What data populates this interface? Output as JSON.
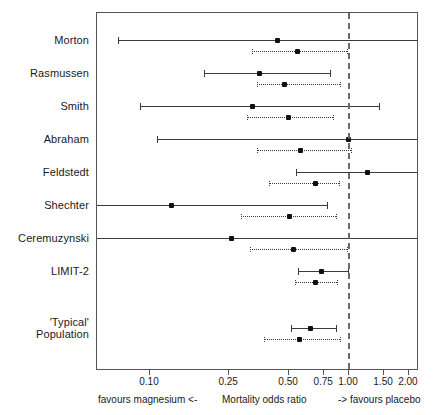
{
  "chart_data": {
    "type": "scatter",
    "subtype": "forest-plot",
    "title": "",
    "xlabel": "Mortality odds ratio",
    "ylabel": "",
    "xscale": "log",
    "xlim": [
      0.065,
      2.35
    ],
    "grid": false,
    "legend": "none",
    "reference_line": 1.0,
    "xticks": [
      0.1,
      0.25,
      0.5,
      0.75,
      1.0,
      1.5,
      2.0
    ],
    "xticklabels": [
      "0.10",
      "0.25",
      "0.50",
      "0.75",
      "1.00",
      "1.50",
      "2.00"
    ],
    "categories": [
      "Morton",
      "Rasmussen",
      "Smith",
      "Abraham",
      "Feldstedt",
      "Shechter",
      "Ceremuzynski",
      "LIMIT-2",
      "'Typical'\nPopulation"
    ],
    "series": [
      {
        "name": "Classical (solid)",
        "style": "solid",
        "estimates": [
          0.44,
          0.36,
          0.33,
          1.0,
          1.25,
          0.13,
          0.26,
          0.74,
          0.65
        ],
        "ci_low": [
          0.07,
          0.19,
          0.09,
          0.11,
          0.55,
          0.03,
          0.04,
          0.56,
          0.52
        ],
        "ci_high": [
          2.35,
          0.81,
          1.43,
          2.35,
          2.35,
          0.78,
          2.35,
          1.0,
          0.87
        ]
      },
      {
        "name": "Bayesian (dotted)",
        "style": "dotted",
        "estimates": [
          0.56,
          0.48,
          0.5,
          0.58,
          0.69,
          0.51,
          0.53,
          0.69,
          0.57
        ],
        "ci_low": [
          0.33,
          0.35,
          0.31,
          0.35,
          0.4,
          0.29,
          0.32,
          0.54,
          0.38
        ],
        "ci_high": [
          0.99,
          0.91,
          0.84,
          1.03,
          0.9,
          0.87,
          0.99,
          0.88,
          0.91
        ]
      }
    ],
    "annotations": {
      "left_caption": "favours magnesium  <-",
      "center_caption": "Mortality odds ratio",
      "right_caption": "->  favours placebo"
    }
  },
  "axis": {
    "ticks": [
      {
        "label": "0.10",
        "value": 0.1
      },
      {
        "label": "0.25",
        "value": 0.25
      },
      {
        "label": "0.50",
        "value": 0.5
      },
      {
        "label": "0.75",
        "value": 0.75
      },
      {
        "label": "1.00",
        "value": 1.0
      },
      {
        "label": "1.50",
        "value": 1.5
      },
      {
        "label": "2.00",
        "value": 2.0
      }
    ],
    "captions": {
      "left": "favours magnesium  <-",
      "center": "Mortality odds ratio",
      "right": "->  favours placebo"
    }
  },
  "studies": [
    {
      "label": "Morton",
      "row_y": 40
    },
    {
      "label": "Rasmussen",
      "row_y": 73
    },
    {
      "label": "Smith",
      "row_y": 106
    },
    {
      "label": "Abraham",
      "row_y": 139
    },
    {
      "label": "Feldstedt",
      "row_y": 172
    },
    {
      "label": "Shechter",
      "row_y": 205
    },
    {
      "label": "Ceremuzynski",
      "row_y": 238
    },
    {
      "label": "LIMIT-2",
      "row_y": 271
    },
    {
      "label": "'Typical'\nPopulation",
      "row_y": 328
    }
  ]
}
